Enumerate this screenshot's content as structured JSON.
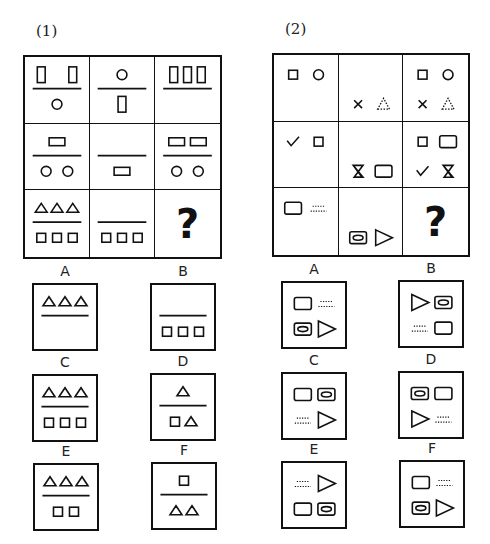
{
  "puzzle1": {
    "label": "(1)",
    "grid": {
      "left": 23,
      "top": 55,
      "width": 199,
      "height": 204,
      "rows": 3,
      "cols": 3
    },
    "cells": [
      {
        "divider": true,
        "top": [
          "rect-tall",
          "rect-tall"
        ],
        "bottom": [
          "circle"
        ]
      },
      {
        "divider": true,
        "top": [
          "circle"
        ],
        "bottom": [
          "rect-tall"
        ]
      },
      {
        "divider": true,
        "top": [
          "rect-tall",
          "rect-tall",
          "rect-tall"
        ],
        "bottom": []
      },
      {
        "divider": true,
        "top": [
          "rect-wide"
        ],
        "bottom": [
          "circle",
          "circle"
        ]
      },
      {
        "divider": true,
        "top": [],
        "bottom": [
          "rect-wide"
        ]
      },
      {
        "divider": true,
        "top": [
          "rect-wide",
          "rect-wide"
        ],
        "bottom": [
          "circle",
          "circle"
        ]
      },
      {
        "divider": true,
        "top": [
          "triangle",
          "triangle",
          "triangle"
        ],
        "bottom": [
          "square",
          "square",
          "square"
        ]
      },
      {
        "divider": true,
        "top": [],
        "bottom": [
          "square",
          "square",
          "square"
        ]
      },
      {
        "question": "?"
      }
    ],
    "options": [
      {
        "letter": "A",
        "left": 32,
        "top": 283,
        "divider": true,
        "top_shapes": [
          "triangle",
          "triangle",
          "triangle"
        ],
        "bottom_shapes": []
      },
      {
        "letter": "B",
        "left": 150,
        "top": 283,
        "divider": true,
        "top_shapes": [],
        "bottom_shapes": [
          "square",
          "square",
          "square"
        ]
      },
      {
        "letter": "C",
        "left": 32,
        "top": 374,
        "divider": true,
        "top_shapes": [
          "triangle",
          "triangle",
          "triangle"
        ],
        "bottom_shapes": [
          "square",
          "square",
          "square"
        ]
      },
      {
        "letter": "D",
        "left": 150,
        "top": 373,
        "divider": true,
        "top_shapes": [
          "triangle"
        ],
        "bottom_shapes": [
          "square",
          "triangle"
        ]
      },
      {
        "letter": "E",
        "left": 33,
        "top": 463,
        "divider": true,
        "top_shapes": [
          "triangle",
          "triangle",
          "triangle"
        ],
        "bottom_shapes": [
          "square",
          "square"
        ]
      },
      {
        "letter": "F",
        "left": 151,
        "top": 462,
        "divider": true,
        "top_shapes": [
          "square"
        ],
        "bottom_shapes": [
          "triangle",
          "triangle"
        ]
      }
    ]
  },
  "puzzle2": {
    "label": "(2)",
    "grid": {
      "left": 272,
      "top": 53,
      "width": 198,
      "height": 204,
      "rows": 3,
      "cols": 3
    },
    "cells": [
      {
        "tl": "square",
        "tr": "circle",
        "bl": null,
        "br": null
      },
      {
        "tl": null,
        "tr": null,
        "bl": "cross",
        "br": "dotted-triangle"
      },
      {
        "tl": "square",
        "tr": "circle",
        "bl": "cross",
        "br": "dotted-triangle"
      },
      {
        "tl": "check",
        "tr": "square",
        "bl": null,
        "br": null
      },
      {
        "tl": null,
        "tr": null,
        "bl": "hourglass",
        "br": "rounded-rect"
      },
      {
        "tl": "square",
        "tr": "rounded-rect",
        "bl": "check",
        "br": "hourglass"
      },
      {
        "tl": "rounded-rect",
        "tr": "dotted-lines",
        "bl": null,
        "br": null
      },
      {
        "tl": null,
        "tr": null,
        "bl": "oval-in-rect",
        "br": "right-triangle"
      },
      {
        "question": "?"
      }
    ],
    "options": [
      {
        "letter": "A",
        "left": 281,
        "top": 281,
        "tl": "rounded-rect",
        "tr": "dotted-lines",
        "bl": "oval-in-rect",
        "br": "right-triangle"
      },
      {
        "letter": "B",
        "left": 398,
        "top": 280,
        "tl": "right-triangle",
        "tr": "oval-in-rect",
        "bl": "dotted-lines",
        "br": "rounded-rect"
      },
      {
        "letter": "C",
        "left": 281,
        "top": 372,
        "tl": "rounded-rect",
        "tr": "oval-in-rect",
        "bl": "dotted-lines",
        "br": "right-triangle"
      },
      {
        "letter": "D",
        "left": 398,
        "top": 371,
        "tl": "oval-in-rect",
        "tr": "rounded-rect",
        "bl": "right-triangle",
        "br": "dotted-lines"
      },
      {
        "letter": "E",
        "left": 281,
        "top": 461,
        "tl": "dotted-lines",
        "tr": "right-triangle",
        "bl": "rounded-rect",
        "br": "oval-in-rect"
      },
      {
        "letter": "F",
        "left": 399,
        "top": 460,
        "tl": "rounded-rect",
        "tr": "dotted-lines",
        "bl": "oval-in-rect",
        "br": "right-triangle"
      }
    ]
  },
  "option_box": {
    "width": 66,
    "height": 68
  },
  "colors": {
    "stroke": "#111111",
    "background": "#ffffff"
  }
}
